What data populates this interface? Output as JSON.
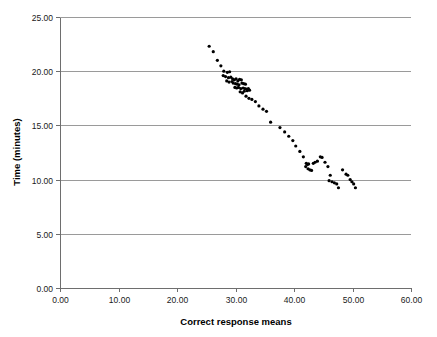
{
  "chart_data": {
    "type": "scatter",
    "title": "",
    "xlabel": "Correct response means",
    "ylabel": "Time (minutes)",
    "xlim": [
      0,
      60
    ],
    "ylim": [
      0,
      25
    ],
    "xticks": [
      "0.00",
      "10.00",
      "20.00",
      "30.00",
      "40.00",
      "50.00",
      "60.00"
    ],
    "xtick_values": [
      0,
      10,
      20,
      30,
      40,
      50,
      60
    ],
    "yticks": [
      "0.00",
      "5.00",
      "10.00",
      "15.00",
      "20.00",
      "25.00"
    ],
    "ytick_values": [
      0,
      5,
      10,
      15,
      20,
      25
    ],
    "grid": "horizontal",
    "legend": "none",
    "marker": "filled-circle",
    "marker_color": "#000000",
    "marker_size_px": 3.2,
    "points": [
      [
        25.5,
        22.3
      ],
      [
        26.2,
        21.8
      ],
      [
        26.9,
        21.0
      ],
      [
        27.5,
        20.5
      ],
      [
        28.0,
        20.0
      ],
      [
        28.6,
        19.9
      ],
      [
        29.0,
        19.95
      ],
      [
        27.9,
        19.6
      ],
      [
        28.3,
        19.5
      ],
      [
        28.8,
        19.4
      ],
      [
        29.2,
        19.45
      ],
      [
        29.5,
        19.3
      ],
      [
        28.5,
        19.1
      ],
      [
        28.9,
        19.0
      ],
      [
        29.4,
        19.05
      ],
      [
        29.8,
        19.2
      ],
      [
        30.1,
        19.3
      ],
      [
        30.4,
        19.1
      ],
      [
        30.7,
        19.25
      ],
      [
        31.0,
        19.2
      ],
      [
        29.6,
        18.9
      ],
      [
        30.0,
        18.85
      ],
      [
        30.3,
        18.8
      ],
      [
        30.6,
        18.75
      ],
      [
        31.1,
        18.9
      ],
      [
        31.4,
        18.85
      ],
      [
        31.7,
        18.8
      ],
      [
        29.9,
        18.5
      ],
      [
        30.2,
        18.45
      ],
      [
        30.5,
        18.5
      ],
      [
        30.9,
        18.4
      ],
      [
        31.3,
        18.45
      ],
      [
        31.6,
        18.4
      ],
      [
        31.9,
        18.35
      ],
      [
        32.2,
        18.4
      ],
      [
        30.8,
        18.1
      ],
      [
        31.2,
        18.0
      ],
      [
        31.5,
        18.15
      ],
      [
        32.0,
        18.2
      ],
      [
        32.4,
        18.25
      ],
      [
        31.8,
        17.7
      ],
      [
        32.3,
        17.5
      ],
      [
        32.8,
        17.4
      ],
      [
        33.4,
        17.2
      ],
      [
        34.0,
        16.8
      ],
      [
        34.7,
        16.5
      ],
      [
        35.3,
        16.3
      ],
      [
        36.0,
        15.3
      ],
      [
        37.6,
        14.8
      ],
      [
        38.4,
        14.4
      ],
      [
        39.1,
        14.0
      ],
      [
        39.8,
        13.6
      ],
      [
        40.3,
        13.1
      ],
      [
        41.0,
        12.6
      ],
      [
        41.6,
        12.1
      ],
      [
        42.1,
        11.5
      ],
      [
        42.3,
        11.4
      ],
      [
        42.5,
        11.45
      ],
      [
        42.0,
        11.2
      ],
      [
        42.4,
        11.0
      ],
      [
        42.7,
        10.9
      ],
      [
        43.0,
        10.85
      ],
      [
        43.3,
        11.5
      ],
      [
        43.6,
        11.6
      ],
      [
        44.0,
        11.7
      ],
      [
        44.5,
        12.1
      ],
      [
        44.8,
        12.05
      ],
      [
        45.3,
        11.6
      ],
      [
        45.8,
        11.2
      ],
      [
        46.2,
        10.4
      ],
      [
        46.0,
        9.9
      ],
      [
        46.5,
        9.8
      ],
      [
        46.9,
        9.7
      ],
      [
        47.3,
        9.6
      ],
      [
        47.6,
        9.25
      ],
      [
        48.3,
        10.9
      ],
      [
        48.9,
        10.5
      ],
      [
        49.2,
        10.4
      ],
      [
        49.6,
        10.0
      ],
      [
        49.9,
        9.8
      ],
      [
        50.2,
        9.6
      ],
      [
        50.5,
        9.25
      ]
    ]
  },
  "layout": {
    "plot_left_px": 60,
    "plot_right_px": 411,
    "plot_top_px": 17,
    "plot_bottom_px": 288
  }
}
